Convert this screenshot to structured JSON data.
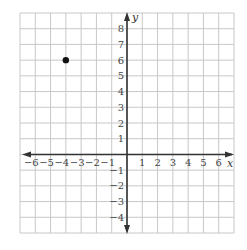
{
  "chart_data": {
    "type": "scatter",
    "title": "",
    "xlabel": "x",
    "ylabel": "y",
    "xlim": [
      -7,
      7
    ],
    "ylim": [
      -5,
      9
    ],
    "grid": true,
    "x_ticks": [
      -6,
      -5,
      -4,
      -3,
      -2,
      -1,
      1,
      2,
      3,
      4,
      5,
      6
    ],
    "y_ticks": [
      -4,
      -3,
      -2,
      -1,
      1,
      2,
      3,
      4,
      5,
      6,
      7,
      8
    ],
    "x_tick_labels": [
      "−6",
      "−5",
      "−4",
      "−3",
      "−2",
      "−1",
      "1",
      "2",
      "3",
      "4",
      "5",
      "6"
    ],
    "y_tick_labels": [
      "−4",
      "−3",
      "−2",
      "−1",
      "1",
      "2",
      "3",
      "4",
      "5",
      "6",
      "7",
      "8"
    ],
    "points": [
      {
        "x": -4,
        "y": 6
      }
    ],
    "colors": {
      "grid": "#c8c8c8",
      "axis": "#333333",
      "point": "#111111",
      "labels": "#444444"
    }
  },
  "axes": {
    "x_name": "x",
    "y_name": "y"
  }
}
